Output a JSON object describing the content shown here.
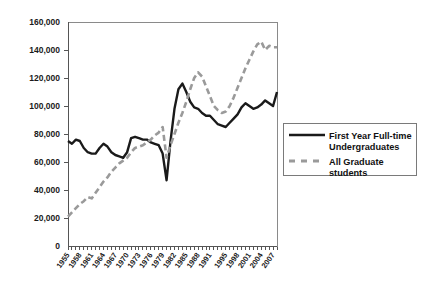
{
  "chart_data": {
    "type": "line",
    "title": "",
    "xlabel": "",
    "ylabel": "",
    "ylim": [
      0,
      160000
    ],
    "xlim": [
      1955,
      2008
    ],
    "grid": false,
    "legend_position": "right",
    "ytick_labels": [
      "160,000",
      "140,000",
      "120,000",
      "100,000",
      "80,000",
      "60,000",
      "40,000",
      "20,000",
      "0"
    ],
    "ytick_values": [
      160000,
      140000,
      120000,
      100000,
      80000,
      60000,
      40000,
      20000,
      0
    ],
    "xtick_labels": [
      "1955",
      "1958",
      "1961",
      "1964",
      "1967",
      "1970",
      "1973",
      "1976",
      "1979",
      "1982",
      "1985",
      "1988",
      "1991",
      "1995",
      "1998",
      "2001",
      "2004",
      "2007"
    ],
    "x": [
      1955,
      1956,
      1957,
      1958,
      1959,
      1960,
      1961,
      1962,
      1963,
      1964,
      1965,
      1966,
      1967,
      1968,
      1969,
      1970,
      1971,
      1972,
      1973,
      1974,
      1975,
      1976,
      1977,
      1978,
      1979,
      1980,
      1981,
      1982,
      1983,
      1984,
      1985,
      1986,
      1987,
      1988,
      1989,
      1990,
      1991,
      1992,
      1993,
      1994,
      1995,
      1996,
      1997,
      1998,
      1999,
      2000,
      2001,
      2002,
      2003,
      2004,
      2005,
      2006,
      2007,
      2008
    ],
    "series": [
      {
        "name": "First Year Full-time Undergraduates",
        "color": "#1a1a1a",
        "style": "solid",
        "values": [
          75000,
          73000,
          76000,
          75000,
          70000,
          67000,
          66000,
          66000,
          70000,
          73000,
          71000,
          67000,
          65000,
          64000,
          63000,
          67000,
          77000,
          78000,
          77000,
          76000,
          76000,
          74000,
          73000,
          72000,
          66000,
          47000,
          75000,
          98000,
          112000,
          116000,
          110000,
          103000,
          99000,
          98000,
          95000,
          93000,
          93000,
          90000,
          87000,
          86000,
          85000,
          88000,
          91000,
          94000,
          99000,
          102000,
          100000,
          98000,
          99000,
          101000,
          104000,
          102000,
          100000,
          110000
        ]
      },
      {
        "name": "All Graduate students",
        "color": "#9a9a9a",
        "style": "dashed",
        "values": [
          21000,
          24000,
          27000,
          30000,
          32000,
          35000,
          34000,
          38000,
          42000,
          46000,
          49000,
          53000,
          56000,
          59000,
          61000,
          63000,
          67000,
          70000,
          71000,
          72000,
          74000,
          76000,
          79000,
          81000,
          85000,
          63000,
          72000,
          80000,
          88000,
          95000,
          103000,
          112000,
          120000,
          124000,
          121000,
          114000,
          107000,
          100000,
          97000,
          95000,
          96000,
          100000,
          106000,
          113000,
          120000,
          127000,
          133000,
          139000,
          144000,
          146000,
          140000,
          143000,
          142000,
          142000
        ]
      }
    ]
  },
  "legend": {
    "entries": [
      {
        "label_line1": "First Year Full-time",
        "label_line2": "Undergraduates"
      },
      {
        "label_line1": "All Graduate",
        "label_line2": "students"
      }
    ]
  }
}
